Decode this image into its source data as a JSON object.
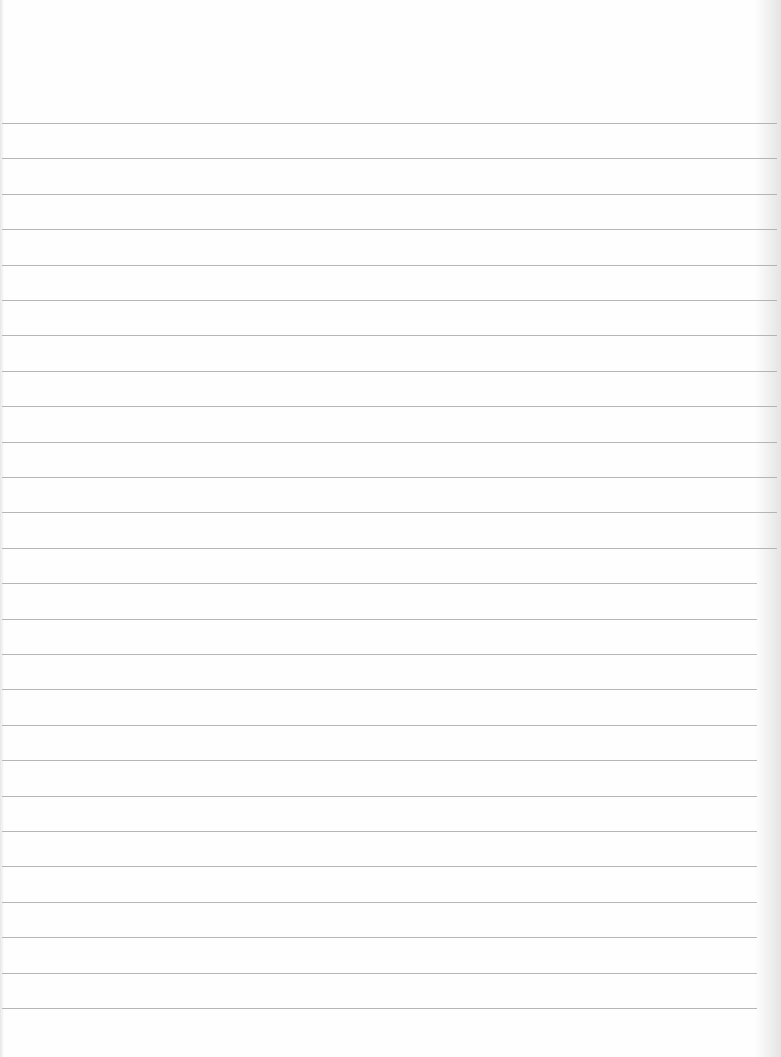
{
  "document": {
    "type": "ruled-paper",
    "background_color": "#fefefe",
    "rule_color": "#a9a9a9",
    "rule_count": 26,
    "first_rule_y": 123,
    "rule_spacing": 35.4,
    "text": ""
  }
}
